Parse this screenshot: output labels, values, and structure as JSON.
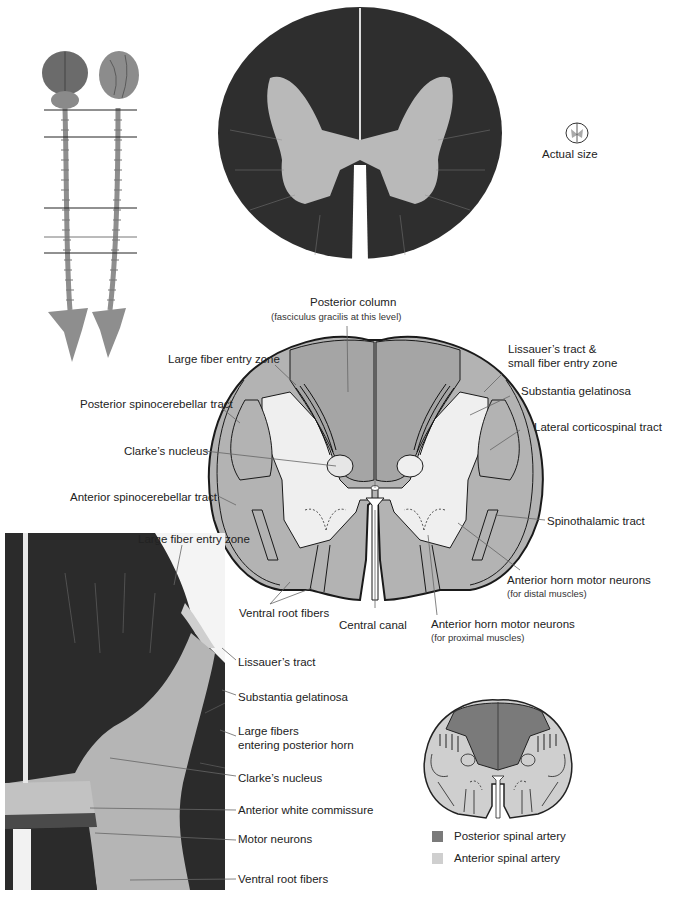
{
  "figure": {
    "panels": {
      "spinal_cord_overview": {
        "description": "Two whole brain-and-spinal-cord specimens with horizontal level markers",
        "level_lines_count": 5
      },
      "stained_section": {
        "description": "Myelin-stained transverse section of spinal cord (thoracic level)"
      },
      "actual_size_icon": {
        "label": "Actual size"
      },
      "schematic": {
        "labels": {
          "posterior_column": "Posterior column",
          "posterior_column_sub": "(fasciculus gracilis at this level)",
          "large_fiber_entry_zone": "Large fiber entry zone",
          "lissauers_tract_line1": "Lissauer’s tract &",
          "lissauers_tract_line2": "small fiber entry zone",
          "substantia_gelatinosa": "Substantia gelatinosa",
          "posterior_spinocerebellar_tract": "Posterior spinocerebellar tract",
          "lateral_corticospinal_tract": "Lateral corticospinal tract",
          "clarkes_nucleus": "Clarke’s nucleus",
          "anterior_spinocerebellar_tract": "Anterior spinocerebellar tract",
          "spinothalamic_tract": "Spinothalamic tract",
          "anterior_horn_distal": "Anterior horn motor neurons",
          "anterior_horn_distal_sub": "(for distal muscles)",
          "ventral_root_fibers": "Ventral root fibers",
          "central_canal": "Central canal",
          "anterior_horn_proximal": "Anterior horn motor neurons",
          "anterior_horn_proximal_sub": "(for proximal muscles)"
        }
      },
      "magnified_section": {
        "labels": {
          "large_fiber_entry_zone": "Large fiber entry zone",
          "lissauers_tract": "Lissauer’s tract",
          "substantia_gelatinosa": "Substantia gelatinosa",
          "large_fibers_line1": "Large fibers",
          "large_fibers_line2": "entering posterior horn",
          "clarkes_nucleus": "Clarke’s nucleus",
          "anterior_white_commissure": "Anterior white commissure",
          "motor_neurons": "Motor neurons",
          "ventral_root_fibers": "Ventral root fibers"
        }
      },
      "blood_supply": {
        "legend": [
          {
            "label": "Posterior spinal artery",
            "color": "#7a7a7a"
          },
          {
            "label": "Anterior spinal artery",
            "color": "#cfcfcf"
          }
        ]
      }
    },
    "colors": {
      "white_matter_stain": "#2e2e2e",
      "gray_matter_stain": "#b9b9b9",
      "schematic_white": "#b3b3b3",
      "schematic_gray": "#efefef",
      "outline": "#1a1a1a",
      "leader_line": "#666666"
    }
  }
}
